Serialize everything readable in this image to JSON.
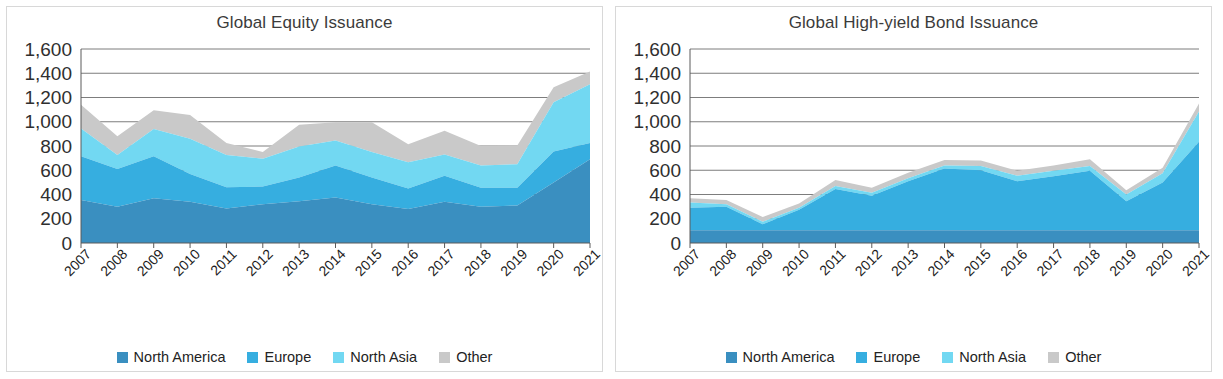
{
  "page": {
    "background": "#ffffff",
    "panel_border": "#d8d8d8"
  },
  "palette": {
    "north_america": "#3a8fc0",
    "europe": "#36aee0",
    "north_asia": "#72d8f2",
    "other": "#c9c9c9",
    "gridline": "#6e6e6e",
    "axis": "#5a5a5a",
    "title_color": "#3b3b3b",
    "tick_color": "#2f2f2f"
  },
  "charts": [
    {
      "id": "global-equity-issuance",
      "title": "Global Equity Issuance",
      "legend": [
        {
          "label": "North America",
          "color": "#3a8fc0",
          "icon": "legend-swatch-north-america"
        },
        {
          "label": "Europe",
          "color": "#36aee0",
          "icon": "legend-swatch-europe"
        },
        {
          "label": "North Asia",
          "color": "#72d8f2",
          "icon": "legend-swatch-north-asia"
        },
        {
          "label": "Other",
          "color": "#c9c9c9",
          "icon": "legend-swatch-other"
        }
      ],
      "chart_data": {
        "type": "area",
        "stacked": true,
        "title": "Global Equity Issuance",
        "xlabel": "",
        "ylabel": "",
        "ylim": [
          0,
          1600
        ],
        "yticks": [
          "0",
          "200",
          "400",
          "600",
          "800",
          "1,000",
          "1,200",
          "1,400",
          "1,600"
        ],
        "ytick_values": [
          0,
          200,
          400,
          600,
          800,
          1000,
          1200,
          1400,
          1600
        ],
        "grid": true,
        "grid_axis": "y",
        "legend_position": "bottom",
        "categories": [
          "2007",
          "2008",
          "2009",
          "2010",
          "2011",
          "2012",
          "2013",
          "2014",
          "2015",
          "2016",
          "2017",
          "2018",
          "2019",
          "2020",
          "2021"
        ],
        "x": [
          "2007",
          "2008",
          "2009",
          "2010",
          "2011",
          "2012",
          "2013",
          "2014",
          "2015",
          "2016",
          "2017",
          "2018",
          "2019",
          "2020",
          "2021"
        ],
        "series": [
          {
            "name": "North America",
            "color": "#3a8fc0",
            "values": [
              355,
              300,
              370,
              340,
              285,
              320,
              345,
              375,
              320,
              280,
              340,
              300,
              310,
              500,
              690
            ]
          },
          {
            "name": "Europe",
            "color": "#36aee0",
            "values": [
              360,
              310,
              345,
              230,
              175,
              145,
              195,
              265,
              220,
              170,
              215,
              155,
              145,
              255,
              135
            ]
          },
          {
            "name": "North Asia",
            "color": "#72d8f2",
            "values": [
              230,
              115,
              225,
              290,
              265,
              230,
              255,
              205,
              210,
              215,
              175,
              185,
              195,
              405,
              485
            ]
          },
          {
            "name": "Other",
            "color": "#c9c9c9",
            "values": [
              195,
              155,
              155,
              195,
              100,
              55,
              180,
              150,
              245,
              150,
              195,
              160,
              155,
              125,
              105
            ]
          }
        ],
        "totals": [
          1140,
          880,
          1095,
          1055,
          825,
          750,
          975,
          995,
          995,
          815,
          925,
          800,
          805,
          1285,
          1415
        ]
      }
    },
    {
      "id": "global-high-yield-bond-issuance",
      "title": "Global High-yield Bond Issuance",
      "legend": [
        {
          "label": "North America",
          "color": "#3a8fc0",
          "icon": "legend-swatch-north-america"
        },
        {
          "label": "Europe",
          "color": "#36aee0",
          "icon": "legend-swatch-europe"
        },
        {
          "label": "North Asia",
          "color": "#72d8f2",
          "icon": "legend-swatch-north-asia"
        },
        {
          "label": "Other",
          "color": "#c9c9c9",
          "icon": "legend-swatch-other"
        }
      ],
      "chart_data": {
        "type": "area",
        "stacked": true,
        "title": "Global High-yield Bond Issuance",
        "xlabel": "",
        "ylabel": "",
        "ylim": [
          0,
          1600
        ],
        "yticks": [
          "0",
          "200",
          "400",
          "600",
          "800",
          "1,000",
          "1,200",
          "1,400",
          "1,600"
        ],
        "ytick_values": [
          0,
          200,
          400,
          600,
          800,
          1000,
          1200,
          1400,
          1600
        ],
        "grid": true,
        "grid_axis": "y",
        "legend_position": "bottom",
        "categories": [
          "2007",
          "2008",
          "2009",
          "2010",
          "2011",
          "2012",
          "2013",
          "2014",
          "2015",
          "2016",
          "2017",
          "2018",
          "2019",
          "2020",
          "2021"
        ],
        "x": [
          "2007",
          "2008",
          "2009",
          "2010",
          "2011",
          "2012",
          "2013",
          "2014",
          "2015",
          "2016",
          "2017",
          "2018",
          "2019",
          "2020",
          "2021"
        ],
        "series": [
          {
            "name": "North America",
            "color": "#3a8fc0",
            "values": [
              105,
              105,
              105,
              105,
              105,
              105,
              105,
              105,
              105,
              105,
              105,
              105,
              105,
              105,
              105
            ]
          },
          {
            "name": "Europe",
            "color": "#36aee0",
            "values": [
              185,
              195,
              50,
              170,
              340,
              285,
              405,
              510,
              495,
              405,
              445,
              490,
              240,
              395,
              730
            ]
          },
          {
            "name": "North Asia",
            "color": "#72d8f2",
            "values": [
              45,
              20,
              20,
              15,
              25,
              25,
              25,
              25,
              35,
              45,
              45,
              40,
              55,
              75,
              250
            ]
          },
          {
            "name": "Other",
            "color": "#c9c9c9",
            "values": [
              35,
              35,
              40,
              35,
              50,
              40,
              45,
              45,
              45,
              40,
              45,
              55,
              35,
              45,
              65
            ]
          }
        ],
        "totals": [
          370,
          355,
          215,
          325,
          520,
          455,
          580,
          685,
          680,
          595,
          640,
          690,
          435,
          620,
          1150
        ]
      }
    }
  ]
}
